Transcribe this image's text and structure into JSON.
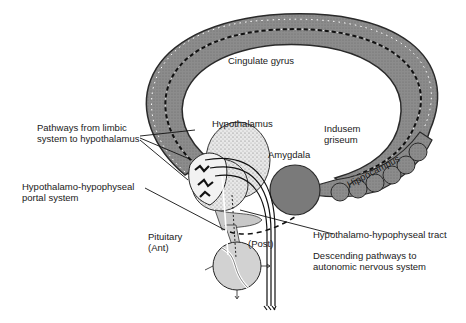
{
  "diagram": {
    "labels": {
      "cingulate_gyrus": "Cingulate gyrus",
      "hypothalamus": "Hypothalamus",
      "pathways_line1": "Pathways from limbic",
      "pathways_line2": "system to hypothalamus",
      "amygdala": "Amygdala",
      "indusem_line1": "Indusem",
      "indusem_line2": "griseum",
      "hippocampus": "Hippocampus",
      "portal_line1": "Hypothalamo-hypophyseal",
      "portal_line2": "portal system",
      "pituitary_line1": "Pituitary",
      "pituitary_line2": "(Ant)",
      "post": "(Post)",
      "tract": "Hypothalamo-hypophyseal tract",
      "descending_line1": "Descending pathways to",
      "descending_line2": "autonomic nervous system"
    },
    "colors": {
      "ring_fill": "#8a8a8a",
      "ring_edge": "#2a2a2a",
      "hypothalamus_fill": "#e6e6e6",
      "pituitary_fill": "#cfcfcf",
      "amygdala_fill": "#7a7a7a",
      "line": "#1a1a1a"
    }
  }
}
